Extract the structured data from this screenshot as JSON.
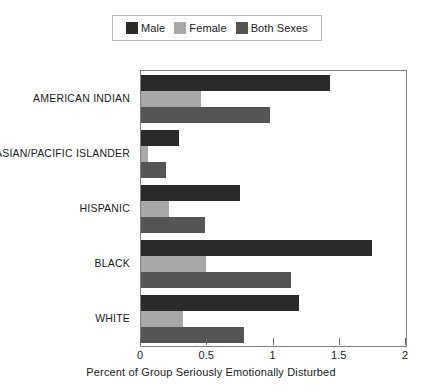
{
  "chart_data": {
    "type": "bar",
    "orientation": "horizontal",
    "title": "",
    "xlabel": "Percent of Group Seriously Emotionally Disturbed",
    "ylabel": "",
    "xlim": [
      0,
      2
    ],
    "xticks": [
      "0",
      "0.5",
      "1",
      "1.5",
      "2"
    ],
    "xtick_values": [
      0,
      0.5,
      1,
      1.5,
      2
    ],
    "grid": false,
    "legend_position": "top-center",
    "categories": [
      "AMERICAN INDIAN",
      "ASIAN/PACIFIC ISLANDER",
      "HISPANIC",
      "BLACK",
      "WHITE"
    ],
    "series": [
      {
        "name": "Male",
        "color": "#2a2a2a",
        "values": [
          1.43,
          0.29,
          0.75,
          1.74,
          1.19
        ]
      },
      {
        "name": "Female",
        "color": "#a8a8a8",
        "values": [
          0.45,
          0.05,
          0.21,
          0.49,
          0.32
        ]
      },
      {
        "name": "Both Sexes",
        "color": "#555555",
        "values": [
          0.97,
          0.19,
          0.48,
          1.13,
          0.78
        ]
      }
    ]
  },
  "legend": {
    "entries": [
      {
        "label": "Male",
        "swatch": "legend-swatch-male"
      },
      {
        "label": "Female",
        "swatch": "legend-swatch-female"
      },
      {
        "label": "Both Sexes",
        "swatch": "legend-swatch-both-sexes"
      }
    ]
  }
}
